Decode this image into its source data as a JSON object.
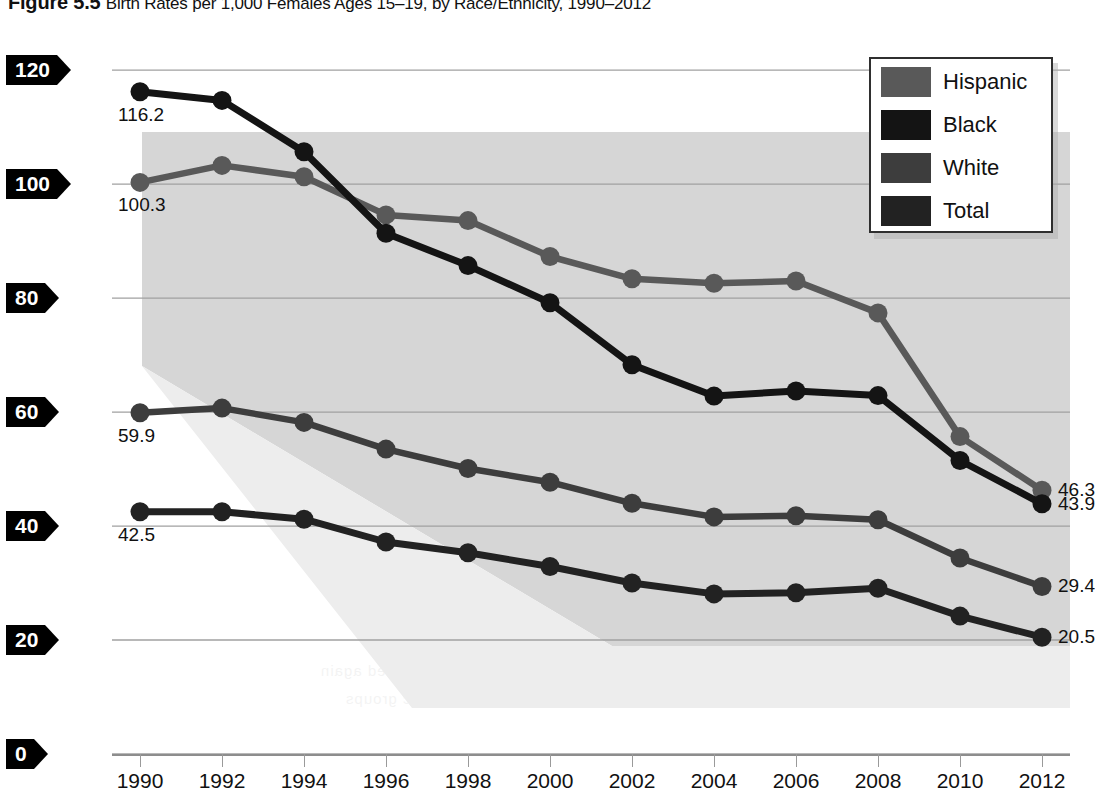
{
  "figure": {
    "number": "Figure 5.5",
    "caption": "Birth Rates per 1,000 Females Ages 15–19, by Race/Ethnicity, 1990–2012"
  },
  "legend": {
    "position": "top-right",
    "items": [
      {
        "label": "Hispanic",
        "color": "#595959"
      },
      {
        "label": "Black",
        "color": "#141414"
      },
      {
        "label": "White",
        "color": "#3d3d3d"
      },
      {
        "label": "Total",
        "color": "#222222"
      }
    ]
  },
  "axes": {
    "y_ticks": [
      "0",
      "20",
      "40",
      "60",
      "80",
      "100",
      "120"
    ],
    "x_ticks": [
      "1990",
      "1992",
      "1994",
      "1996",
      "1998",
      "2000",
      "2002",
      "2004",
      "2006",
      "2008",
      "2010",
      "2012"
    ],
    "y_min": 0,
    "y_max": 126,
    "grid": true
  },
  "annotations": {
    "start": [
      {
        "series": "Black",
        "value": "116.2"
      },
      {
        "series": "Hispanic",
        "value": "100.3"
      },
      {
        "series": "White",
        "value": "59.9"
      },
      {
        "series": "Total",
        "value": "42.5"
      }
    ],
    "end": [
      {
        "series": "Hispanic",
        "value": "46.3"
      },
      {
        "series": "Black",
        "value": "43.9"
      },
      {
        "series": "White",
        "value": "29.4"
      },
      {
        "series": "Total",
        "value": "20.5"
      }
    ]
  },
  "ghost_text": [
    "the teen birth rate declined again",
    "among all race and ethnic groups"
  ],
  "chart_data": {
    "type": "line",
    "title": "Birth Rates per 1,000 Females Ages 15–19, by Race/Ethnicity, 1990–2012",
    "xlabel": "",
    "ylabel": "Births per 1,000 females ages 15–19",
    "x": [
      1990,
      1992,
      1994,
      1996,
      1998,
      2000,
      2002,
      2004,
      2006,
      2008,
      2010,
      2012
    ],
    "xlim": [
      1990,
      2012
    ],
    "ylim": [
      0,
      126
    ],
    "yticks": [
      0,
      20,
      40,
      60,
      80,
      100,
      120
    ],
    "grid": true,
    "legend_position": "upper right",
    "series": [
      {
        "name": "Hispanic",
        "color": "#595959",
        "values": [
          100.3,
          103.3,
          101.3,
          94.6,
          93.6,
          87.3,
          83.4,
          82.6,
          83.0,
          77.4,
          55.7,
          46.3
        ]
      },
      {
        "name": "Black",
        "color": "#141414",
        "values": [
          116.2,
          114.7,
          105.7,
          91.4,
          85.7,
          79.2,
          68.3,
          62.8,
          63.7,
          62.9,
          51.5,
          43.9
        ]
      },
      {
        "name": "White",
        "color": "#3d3d3d",
        "values": [
          59.9,
          60.7,
          58.2,
          53.5,
          50.1,
          47.7,
          44.0,
          41.6,
          41.8,
          41.1,
          34.4,
          29.4
        ]
      },
      {
        "name": "Total",
        "color": "#222222",
        "values": [
          42.5,
          42.5,
          41.2,
          37.2,
          35.3,
          32.9,
          30.0,
          28.1,
          28.3,
          29.1,
          24.2,
          20.5
        ]
      }
    ]
  }
}
